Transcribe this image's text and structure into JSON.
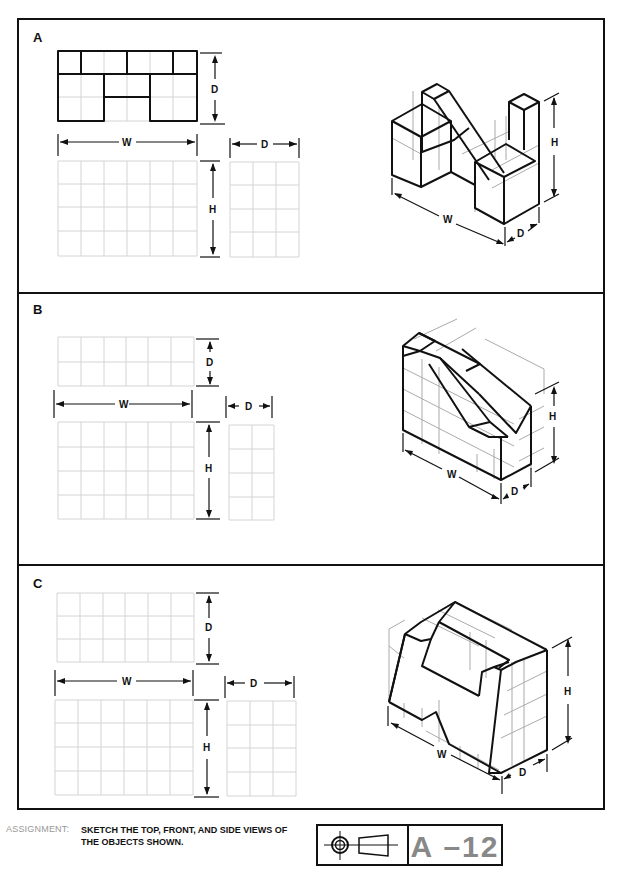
{
  "panels": [
    {
      "label": "A",
      "dims": {
        "w": "W",
        "d_top": "D",
        "d_side": "D",
        "h": "H",
        "iso_w": "W",
        "iso_d": "D",
        "iso_h": "H"
      }
    },
    {
      "label": "B",
      "dims": {
        "w": "W",
        "d_top": "D",
        "d_side": "D",
        "h": "H",
        "iso_w": "W",
        "iso_d": "D",
        "iso_h": "H"
      }
    },
    {
      "label": "C",
      "dims": {
        "w": "W",
        "d_top": "D",
        "d_side": "D",
        "h": "H",
        "iso_w": "W",
        "iso_d": "D",
        "iso_h": "H"
      }
    }
  ],
  "footer": {
    "assignment_label": "ASSIGNMENT:",
    "assignment_line1": "SKETCH THE TOP, FRONT, AND SIDE VIEWS OF",
    "assignment_line2": "THE OBJECTS SHOWN.",
    "projection_symbol": "third-angle-projection-icon",
    "sheet_code": "A –12"
  },
  "colors": {
    "line": "#111111",
    "grid": "#d4d4d4",
    "code": "#888888"
  }
}
